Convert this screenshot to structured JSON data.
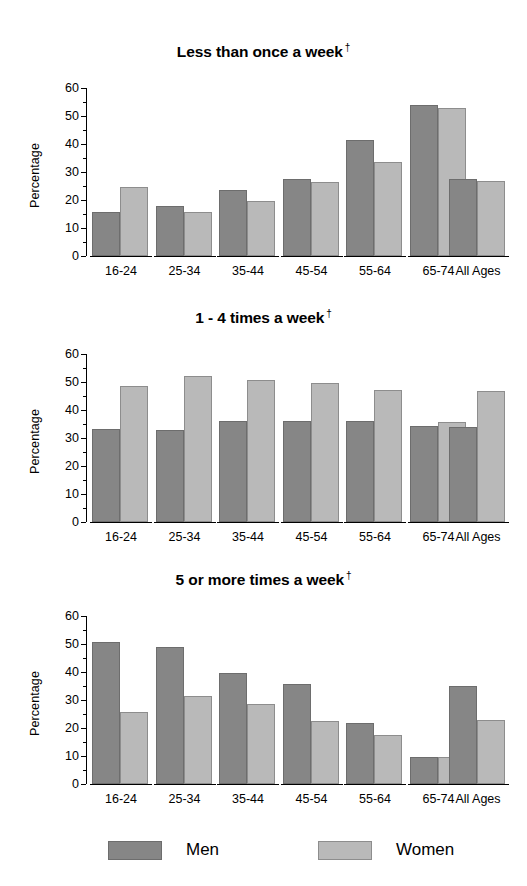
{
  "figure": {
    "ylabel": "Percentage",
    "dagger": "†",
    "men_color": "#868686",
    "women_color": "#b9b9b9"
  },
  "legend": {
    "position": "bottom",
    "items": [
      {
        "label": "Men",
        "key": "men"
      },
      {
        "label": "Women",
        "key": "women"
      }
    ]
  },
  "chart_data": [
    {
      "type": "bar",
      "title": "Less than once a week",
      "title_marker": "†",
      "xlabel": "",
      "ylabel": "Percentage",
      "ylim": [
        0,
        60
      ],
      "yticks": [
        0,
        10,
        20,
        30,
        40,
        50,
        60
      ],
      "yminor": [
        5,
        15,
        25,
        35,
        45,
        55
      ],
      "grid": false,
      "categories": [
        "16-24",
        "25-34",
        "35-44",
        "45-54",
        "55-64",
        "65-74",
        "All Ages"
      ],
      "series": [
        {
          "name": "Men",
          "values": [
            15.8,
            18.0,
            23.5,
            27.4,
            41.4,
            54.1,
            27.6
          ]
        },
        {
          "name": "Women",
          "values": [
            24.7,
            15.7,
            19.6,
            26.5,
            33.4,
            53.0,
            26.8
          ]
        }
      ]
    },
    {
      "type": "bar",
      "title": "1 - 4 times a week",
      "title_marker": "†",
      "xlabel": "",
      "ylabel": "Percentage",
      "ylim": [
        0,
        60
      ],
      "yticks": [
        0,
        10,
        20,
        30,
        40,
        50,
        60
      ],
      "yminor": [
        5,
        15,
        25,
        35,
        45,
        55
      ],
      "grid": false,
      "categories": [
        "16-24",
        "25-34",
        "35-44",
        "45-54",
        "55-64",
        "65-74",
        "All Ages"
      ],
      "series": [
        {
          "name": "Men",
          "values": [
            33.2,
            33.0,
            36.1,
            35.9,
            35.9,
            34.4,
            34.1
          ]
        },
        {
          "name": "Women",
          "values": [
            48.7,
            52.0,
            50.6,
            49.5,
            47.2,
            35.6,
            46.8
          ]
        }
      ]
    },
    {
      "type": "bar",
      "title": "5 or more times a week",
      "title_marker": "†",
      "xlabel": "",
      "ylabel": "Percentage",
      "ylim": [
        0,
        60
      ],
      "yticks": [
        0,
        10,
        20,
        30,
        40,
        50,
        60
      ],
      "yminor": [
        5,
        15,
        25,
        35,
        45,
        55
      ],
      "grid": false,
      "categories": [
        "16-24",
        "25-34",
        "35-44",
        "45-54",
        "55-64",
        "65-74",
        "All Ages"
      ],
      "series": [
        {
          "name": "Men",
          "values": [
            50.8,
            49.0,
            39.6,
            35.6,
            21.9,
            9.6,
            35.0
          ]
        },
        {
          "name": "Women",
          "values": [
            25.8,
            31.5,
            28.4,
            22.6,
            17.6,
            9.6,
            23.0
          ]
        }
      ]
    }
  ]
}
